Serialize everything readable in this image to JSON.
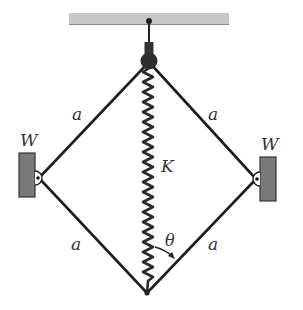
{
  "diagram": {
    "labels": {
      "bar_upper_left": "a",
      "bar_upper_right": "a",
      "bar_lower_left": "a",
      "bar_lower_right": "a",
      "weight_left": "W",
      "weight_right": "W",
      "spring": "K",
      "angle": "θ"
    },
    "colors": {
      "ceiling": "#c8c8c8",
      "ceiling_edge": "#888888",
      "bars": "#1e1e1e",
      "weights": "#7a7a7a",
      "spring": "#2a2a2a",
      "text": "#333333"
    },
    "geometry": {
      "top_joint": [
        149,
        62
      ],
      "bottom_joint": [
        147,
        293
      ],
      "left_joint": [
        39,
        178
      ],
      "right_joint": [
        256,
        179
      ],
      "spring_coils": 22
    }
  }
}
